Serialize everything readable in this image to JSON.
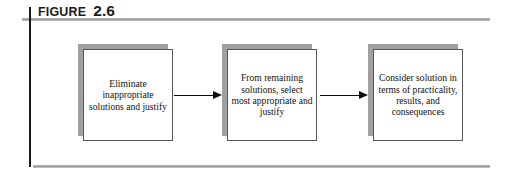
{
  "figure": {
    "label_word": "FIGURE",
    "label_number": "2.6"
  },
  "colors": {
    "rule": "#9a9a9a",
    "spine": "#1a1a1a",
    "box_shadow": "#a0a0a0",
    "box_border": "#58585a",
    "box_fill": "#ffffff",
    "arrow": "#0d0d0d",
    "text": "#111111",
    "background": "#ffffff"
  },
  "flow": {
    "type": "process-flow",
    "direction": "left-to-right",
    "steps": [
      {
        "index": 1,
        "text": "Eliminate inappropriate solutions and justify",
        "lines": [
          "Eliminate",
          "inappropriate",
          "solutions and",
          "justify"
        ]
      },
      {
        "index": 2,
        "text": "From remaining solutions, select most appropriate and justify",
        "lines": [
          "From",
          "remaining",
          "solutions,",
          "select most",
          "appropriate",
          "and justify"
        ]
      },
      {
        "index": 3,
        "text": "Consider solution in terms of practicality, results, and consequences",
        "lines": [
          "Consider",
          "solution in",
          "terms of",
          "practicality,",
          "results, and",
          "consequences"
        ]
      }
    ],
    "connectors": [
      {
        "from": 1,
        "to": 2,
        "glyph": "arrow-right"
      },
      {
        "from": 2,
        "to": 3,
        "glyph": "arrow-right"
      }
    ]
  }
}
